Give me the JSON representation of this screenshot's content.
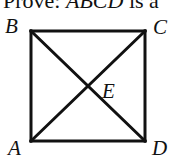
{
  "caption": {
    "prefix": "Prove: ",
    "subject": "ABCD",
    "suffix": " is a"
  },
  "figure": {
    "shape": "square",
    "stroke_color": "#111111",
    "stroke_width": 3,
    "vertices": {
      "A": {
        "label": "A",
        "x": 31,
        "y": 141
      },
      "B": {
        "label": "B",
        "x": 31,
        "y": 31
      },
      "C": {
        "label": "C",
        "x": 145,
        "y": 31
      },
      "D": {
        "label": "D",
        "x": 145,
        "y": 141
      }
    },
    "intersection": {
      "label": "E",
      "x": 88,
      "y": 86
    },
    "segments": [
      {
        "from": "A",
        "to": "B"
      },
      {
        "from": "B",
        "to": "C"
      },
      {
        "from": "C",
        "to": "D"
      },
      {
        "from": "D",
        "to": "A"
      },
      {
        "from": "A",
        "to": "C"
      },
      {
        "from": "B",
        "to": "D"
      }
    ]
  }
}
